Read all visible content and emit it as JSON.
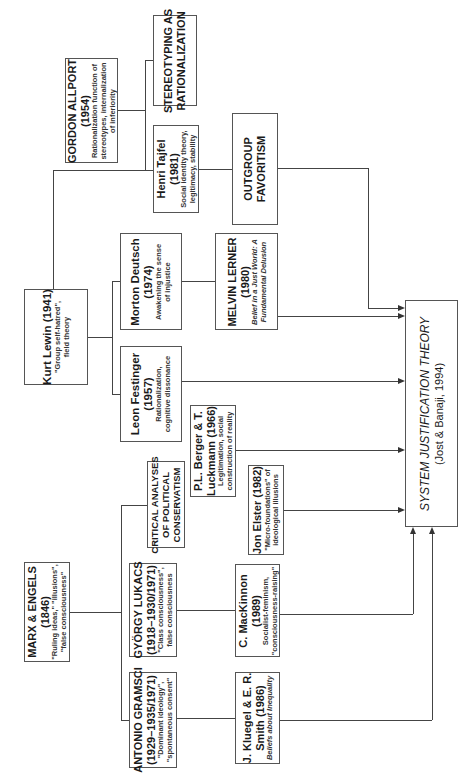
{
  "nodes": {
    "allport": {
      "title_1": "GORDON ALLPORT",
      "title_2": "(1954)",
      "sub_1": "Rationalization function of",
      "sub_2": "stereotypes, internalization",
      "sub_3": "of inferiority"
    },
    "stereotyping": {
      "line_1": "STEREOTYPING AS",
      "line_2": "RATIONALIZATION"
    },
    "tajfel": {
      "title_1": "Henri Tajfel",
      "title_2": "(1981)",
      "sub_1": "Social identity theory,",
      "sub_2": "legitimacy, stability"
    },
    "outgroup": {
      "line_1": "OUTGROUP",
      "line_2": "FAVORITISM"
    },
    "lewin": {
      "title_1": "Kurt Lewin (1941)",
      "sub_1": "\"Group self-hatred\",",
      "sub_2": "field theory"
    },
    "deutsch": {
      "title_1": "Morton Deutsch",
      "title_2": "(1974)",
      "sub_1": "Awakening the sense",
      "sub_2": "of injustice"
    },
    "lerner": {
      "title_1": "MELVIN LERNER",
      "title_2": "(1980)",
      "sub_1": "Belief in a Just World: A",
      "sub_2": "Fundamental Delusion"
    },
    "festinger": {
      "title_1": "Leon Festinger",
      "title_2": "(1957)",
      "sub_1": "Rationalization,",
      "sub_2": "cognitive dissonance"
    },
    "berger": {
      "title_1": "P.L. Berger & T.",
      "title_2": "Luckmann (1966)",
      "sub_1": "Legitimation, social",
      "sub_2": "construction of reality"
    },
    "elster": {
      "title_1": "Jon Elster (1982)",
      "sub_1": "\"Micro-foundations\" of",
      "sub_2": "ideological illusions"
    },
    "critical": {
      "line_1": "CRITICAL ANALYSES",
      "line_2": "OF POLITICAL",
      "line_3": "CONSERVATISM"
    },
    "marx": {
      "title_1": "MARX & ENGELS",
      "title_2": "(1846)",
      "sub_1": "\"Ruling ideas,\" \"illusions\",",
      "sub_2": "\"false consciousness\""
    },
    "lukacs": {
      "title_1": "GYÖRGY LUKACS",
      "title_2": "(1918–1930/1971)",
      "sub_1": "\"Class consciousness\",",
      "sub_2": "false consciousness"
    },
    "gramsci": {
      "title_1": "ANTONIO GRAMSCI",
      "title_2": "(1929–1935/1971)",
      "sub_1": "\"Dominant ideology\",",
      "sub_2": "\"spontaneous consent\""
    },
    "mackinnon": {
      "title_1": "C. MacKinnon",
      "title_2": "(1989)",
      "sub_1": "Socialist-feminism,",
      "sub_2": "\"consciousness-raising\""
    },
    "kluegel": {
      "title_1": "J. Kluegel & E. R.",
      "title_2": "Smith (1986)",
      "sub_1": "Beliefs about Inequality"
    },
    "sjt": {
      "line_1": "SYSTEM JUSTIFICATION THEORY",
      "line_2": "(Jost & Banaji, 1994)"
    }
  }
}
